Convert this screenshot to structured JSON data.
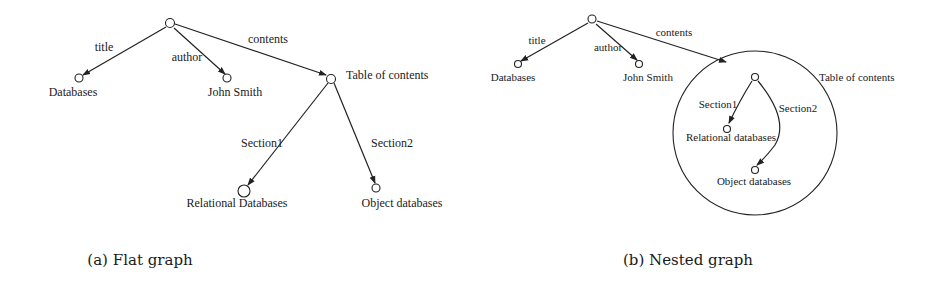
{
  "figure": {
    "panel_a": {
      "caption": "(a) Flat graph",
      "nodes": {
        "root": "",
        "databases": "Databases",
        "john_smith": "John Smith",
        "toc": "Table of contents",
        "relational": "Relational Databases",
        "object": "Object databases"
      },
      "edges": {
        "title": "title",
        "author": "author",
        "contents": "contents",
        "section1": "Section1",
        "section2": "Section2"
      }
    },
    "panel_b": {
      "caption": "(b) Nested graph",
      "nodes": {
        "root": "",
        "databases": "Databases",
        "john_smith": "John Smith",
        "toc": "Table of contents",
        "relational": "Relational databases",
        "object": "Object databases"
      },
      "edges": {
        "title": "title",
        "author": "author",
        "contents": "contents",
        "section1": "Section1",
        "section2": "Section2"
      }
    }
  }
}
